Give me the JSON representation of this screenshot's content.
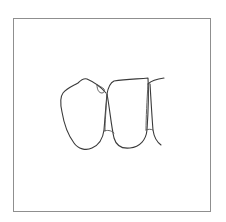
{
  "figure": {
    "type": "line-drawing",
    "frame_color": "#8f8f8f",
    "stroke_color": "#3a3a3a",
    "background": "#ffffff",
    "elements": [
      {
        "name": "left-tooth",
        "label": ""
      },
      {
        "name": "middle-tooth",
        "label": ""
      },
      {
        "name": "right-partial-tooth",
        "label": ""
      },
      {
        "name": "small-cusp-detail",
        "label": ""
      }
    ]
  }
}
